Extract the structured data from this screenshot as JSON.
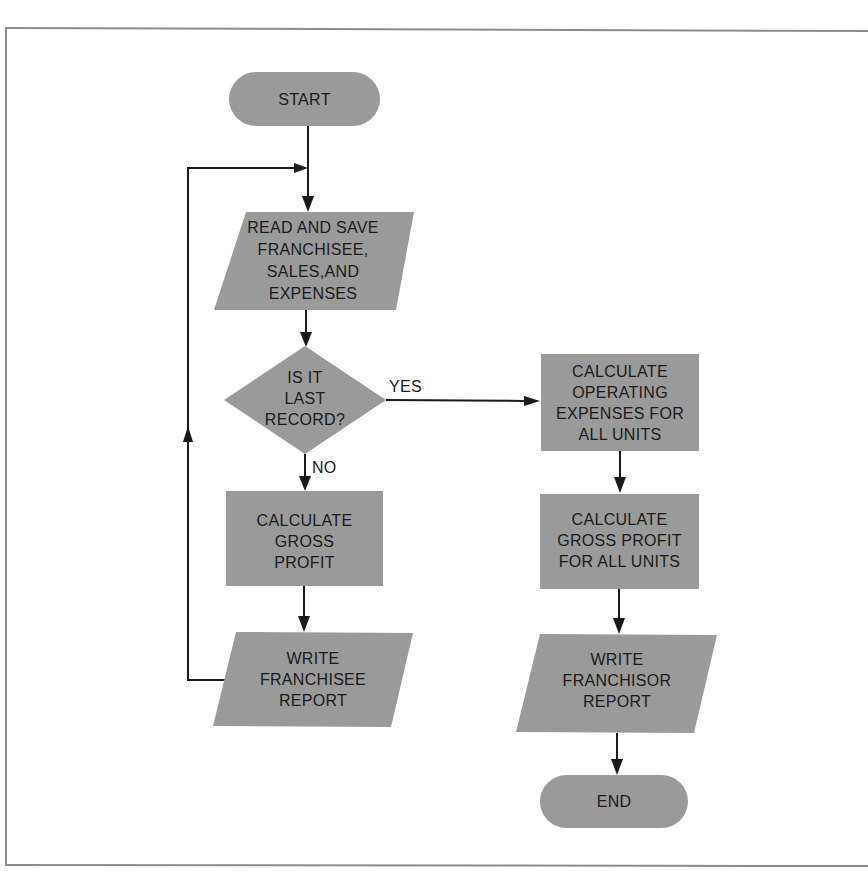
{
  "diagram": {
    "type": "flowchart",
    "colors": {
      "node_fill": "#9a9a9a",
      "line": "#1a1a1a",
      "background": "#ffffff",
      "frame": "#8c8c8c"
    },
    "nodes": {
      "start": {
        "shape": "terminator",
        "lines": [
          "START"
        ]
      },
      "read": {
        "shape": "io",
        "lines": [
          "READ AND SAVE",
          "FRANCHISEE,",
          "SALES,AND",
          "EXPENSES"
        ]
      },
      "decision": {
        "shape": "decision",
        "lines": [
          "IS IT",
          "LAST",
          "RECORD?"
        ]
      },
      "calc_gross": {
        "shape": "process",
        "lines": [
          "CALCULATE",
          "GROSS",
          "PROFIT"
        ]
      },
      "write_franchisee": {
        "shape": "io",
        "lines": [
          "WRITE",
          "FRANCHISEE",
          "REPORT"
        ]
      },
      "calc_operating": {
        "shape": "process",
        "lines": [
          "CALCULATE",
          "OPERATING",
          "EXPENSES FOR",
          "ALL UNITS"
        ]
      },
      "calc_gross_all": {
        "shape": "process",
        "lines": [
          "CALCULATE",
          "GROSS PROFIT",
          "FOR ALL UNITS"
        ]
      },
      "write_franchisor": {
        "shape": "io",
        "lines": [
          "WRITE",
          "FRANCHISOR",
          "REPORT"
        ]
      },
      "end": {
        "shape": "terminator",
        "lines": [
          "END"
        ]
      }
    },
    "edge_labels": {
      "yes": "YES",
      "no": "NO"
    },
    "edges": [
      {
        "from": "start",
        "to": "read"
      },
      {
        "from": "read",
        "to": "decision"
      },
      {
        "from": "decision",
        "to": "calc_operating",
        "label": "YES"
      },
      {
        "from": "decision",
        "to": "calc_gross",
        "label": "NO"
      },
      {
        "from": "calc_gross",
        "to": "write_franchisee"
      },
      {
        "from": "write_franchisee",
        "to": "read",
        "note": "loop back"
      },
      {
        "from": "calc_operating",
        "to": "calc_gross_all"
      },
      {
        "from": "calc_gross_all",
        "to": "write_franchisor"
      },
      {
        "from": "write_franchisor",
        "to": "end"
      }
    ]
  }
}
